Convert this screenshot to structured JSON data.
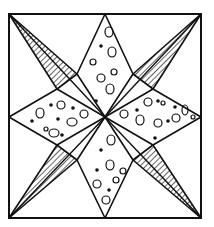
{
  "figure": {
    "colors": {
      "line": "#111111",
      "background": "#ffffff"
    },
    "frame": {
      "x1": 9,
      "y1": 14,
      "x2": 201,
      "y2": 218
    },
    "center": {
      "x": 105,
      "y": 117
    },
    "diamonds": [
      {
        "name": "top",
        "points": "105,117 77,74 105,14 133,74"
      },
      {
        "name": "bottom",
        "points": "105,117 133,160 105,218 77,160"
      },
      {
        "name": "left",
        "points": "105,117 57,145 9,117 57,89"
      },
      {
        "name": "right",
        "points": "105,117 153,89 201,117 153,145"
      }
    ],
    "hatched_triangles": [
      {
        "name": "top-left",
        "points": "9,14 77,74 57,89"
      },
      {
        "name": "top-right",
        "points": "201,14 153,89 133,74"
      },
      {
        "name": "bottom-left",
        "points": "9,218 57,145 77,160"
      },
      {
        "name": "bottom-right",
        "points": "201,218 133,160 153,145"
      }
    ],
    "dots": [
      {
        "x": 101,
        "y": 46
      },
      {
        "x": 96,
        "y": 101
      },
      {
        "x": 101,
        "y": 150
      },
      {
        "x": 97,
        "y": 170
      },
      {
        "x": 109,
        "y": 190
      },
      {
        "x": 51,
        "y": 105
      },
      {
        "x": 32,
        "y": 121
      },
      {
        "x": 58,
        "y": 119
      },
      {
        "x": 73,
        "y": 108
      },
      {
        "x": 62,
        "y": 135
      },
      {
        "x": 137,
        "y": 110
      },
      {
        "x": 158,
        "y": 101
      },
      {
        "x": 175,
        "y": 107
      },
      {
        "x": 155,
        "y": 138
      },
      {
        "x": 168,
        "y": 121
      }
    ],
    "bubbles": [
      {
        "x": 109,
        "y": 32,
        "rx": 4,
        "ry": 5
      },
      {
        "x": 112,
        "y": 52,
        "rx": 4,
        "ry": 5
      },
      {
        "x": 93,
        "y": 62,
        "rx": 3,
        "ry": 3
      },
      {
        "x": 101,
        "y": 78,
        "rx": 4,
        "ry": 4
      },
      {
        "x": 114,
        "y": 72,
        "rx": 3,
        "ry": 3
      },
      {
        "x": 110,
        "y": 89,
        "rx": 4,
        "ry": 5
      },
      {
        "x": 40,
        "y": 113,
        "rx": 4,
        "ry": 5
      },
      {
        "x": 61,
        "y": 105,
        "rx": 4,
        "ry": 4
      },
      {
        "x": 72,
        "y": 122,
        "rx": 5,
        "ry": 4
      },
      {
        "x": 84,
        "y": 114,
        "rx": 4,
        "ry": 4
      },
      {
        "x": 54,
        "y": 133,
        "rx": 5,
        "ry": 4
      },
      {
        "x": 46,
        "y": 129,
        "rx": 2,
        "ry": 2
      },
      {
        "x": 124,
        "y": 114,
        "rx": 4,
        "ry": 4
      },
      {
        "x": 140,
        "y": 120,
        "rx": 4,
        "ry": 5
      },
      {
        "x": 148,
        "y": 102,
        "rx": 4,
        "ry": 4
      },
      {
        "x": 163,
        "y": 103,
        "rx": 2,
        "ry": 2
      },
      {
        "x": 158,
        "y": 123,
        "rx": 4,
        "ry": 4
      },
      {
        "x": 176,
        "y": 118,
        "rx": 4,
        "ry": 4
      },
      {
        "x": 185,
        "y": 110,
        "rx": 3,
        "ry": 5
      },
      {
        "x": 193,
        "y": 117,
        "rx": 2,
        "ry": 2
      },
      {
        "x": 111,
        "y": 140,
        "rx": 4,
        "ry": 5
      },
      {
        "x": 110,
        "y": 165,
        "rx": 4,
        "ry": 5
      },
      {
        "x": 97,
        "y": 184,
        "rx": 4,
        "ry": 4
      },
      {
        "x": 116,
        "y": 180,
        "rx": 3,
        "ry": 3
      },
      {
        "x": 106,
        "y": 200,
        "rx": 4,
        "ry": 4
      },
      {
        "x": 123,
        "y": 171,
        "rx": 3,
        "ry": 3
      }
    ]
  }
}
